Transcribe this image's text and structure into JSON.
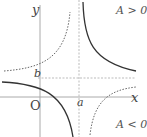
{
  "diagram": {
    "title": "",
    "function": "y = b + A/(x - a)",
    "axes": {
      "x_label": "x",
      "y_label": "y",
      "origin_label": "O"
    },
    "asymptotes": {
      "vertical_label": "a",
      "horizontal_label": "b"
    },
    "cases": [
      {
        "label": "A > 0",
        "style": "solid"
      },
      {
        "label": "A < 0",
        "style": "dotted"
      }
    ],
    "colors": {
      "axis": "#aaaaaa",
      "curve": "#333333",
      "asymptote": "#bbbbbb"
    }
  }
}
